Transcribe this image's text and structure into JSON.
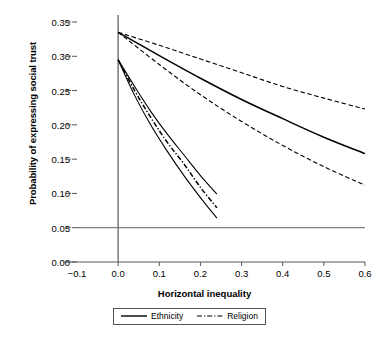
{
  "chart_data": {
    "type": "line",
    "title": "",
    "xlabel": "Horizontal inequality",
    "ylabel": "Probability of expressing social trust",
    "xlim": [
      -0.1,
      0.6
    ],
    "ylim": [
      0.0,
      0.35
    ],
    "xticks": [
      "-0.1",
      "0.0",
      "0.1",
      "0.2",
      "0.3",
      "0.4",
      "0.5",
      "0.6"
    ],
    "xtick_values": [
      -0.1,
      0.0,
      0.1,
      0.2,
      0.3,
      0.4,
      0.5,
      0.6
    ],
    "yticks": [
      "0.00",
      "0.05",
      "0.10",
      "0.15",
      "0.20",
      "0.25",
      "0.30",
      "0.35"
    ],
    "ytick_values": [
      0.0,
      0.05,
      0.1,
      0.15,
      0.2,
      0.25,
      0.3,
      0.35
    ],
    "grid": false,
    "reference_lines": [
      {
        "name": "baseline-0.05",
        "orientation": "horizontal",
        "value": 0.05,
        "color": "#808080"
      },
      {
        "name": "axis-zero",
        "orientation": "vertical",
        "value": 0.0,
        "color": "#808080"
      }
    ],
    "legend_position": "below-axis",
    "series": [
      {
        "name": "Ethnicity",
        "style": "solid",
        "role": "estimate",
        "color": "#000000",
        "x": [
          0.0,
          0.1,
          0.2,
          0.3,
          0.4,
          0.5,
          0.6
        ],
        "values": [
          0.335,
          0.301,
          0.268,
          0.237,
          0.209,
          0.182,
          0.158
        ]
      },
      {
        "name": "Ethnicity upper bound",
        "style": "dashed",
        "role": "confidence-upper",
        "color": "#000000",
        "x": [
          0.0,
          0.1,
          0.2,
          0.3,
          0.4,
          0.5,
          0.6
        ],
        "values": [
          0.335,
          0.316,
          0.296,
          0.276,
          0.256,
          0.239,
          0.223
        ]
      },
      {
        "name": "Ethnicity lower bound",
        "style": "dashed",
        "role": "confidence-lower",
        "color": "#000000",
        "x": [
          0.0,
          0.1,
          0.2,
          0.3,
          0.4,
          0.5,
          0.6
        ],
        "values": [
          0.335,
          0.288,
          0.244,
          0.205,
          0.17,
          0.139,
          0.112
        ]
      },
      {
        "name": "Religion",
        "style": "dash-dot",
        "role": "estimate",
        "color": "#000000",
        "x": [
          0.0,
          0.04,
          0.08,
          0.12,
          0.16,
          0.2,
          0.24
        ],
        "values": [
          0.295,
          0.25,
          0.21,
          0.174,
          0.143,
          0.109,
          0.079
        ]
      },
      {
        "name": "Religion upper bound",
        "style": "solid",
        "role": "confidence-upper",
        "color": "#000000",
        "x": [
          0.0,
          0.04,
          0.08,
          0.12,
          0.16,
          0.2,
          0.24
        ],
        "values": [
          0.295,
          0.256,
          0.219,
          0.186,
          0.156,
          0.126,
          0.099
        ]
      },
      {
        "name": "Religion lower bound",
        "style": "solid",
        "role": "confidence-lower",
        "color": "#000000",
        "x": [
          0.0,
          0.04,
          0.08,
          0.12,
          0.16,
          0.2,
          0.24
        ],
        "values": [
          0.295,
          0.243,
          0.199,
          0.161,
          0.126,
          0.094,
          0.064
        ]
      }
    ]
  },
  "legend": {
    "entries": [
      {
        "label": "Ethnicity",
        "style": "solid"
      },
      {
        "label": "Religion",
        "style": "dash-dot"
      }
    ]
  }
}
